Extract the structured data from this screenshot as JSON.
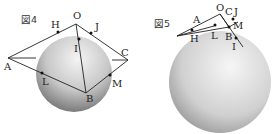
{
  "figures": [
    {
      "title": "図4",
      "points": {
        "O": "O",
        "H": "H",
        "J": "J",
        "I": "I",
        "A": "A",
        "C": "C",
        "L": "L",
        "M": "M",
        "B": "B"
      }
    },
    {
      "title": "図5",
      "points": {
        "O": "O",
        "C": "C",
        "J": "J",
        "A": "A",
        "M": "M",
        "H": "H",
        "L": "L",
        "B": "B",
        "I": "I"
      }
    }
  ]
}
